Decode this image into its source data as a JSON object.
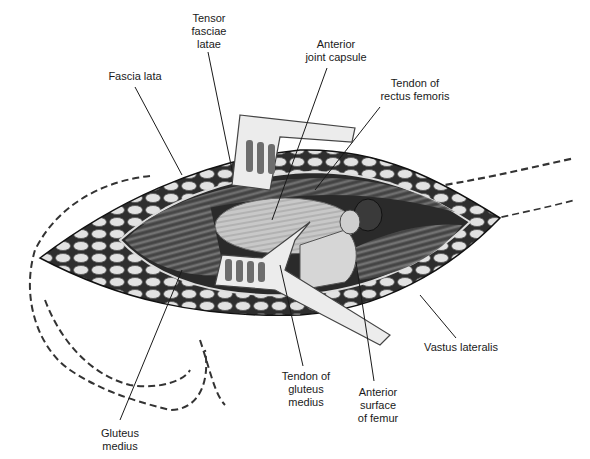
{
  "figure": {
    "colors": {
      "background": "#ffffff",
      "ink": "#1a1a1a",
      "fat": "#d8d8d8",
      "fat_dark": "#3a3a3a",
      "muscle": "#6b6b6b",
      "capsule": "#bdbdbd",
      "retractor": "#e6e6e6"
    }
  },
  "labels": {
    "tensor_fasciae_latae": [
      "Tensor",
      "fasciae",
      "latae"
    ],
    "fascia_lata": [
      "Fascia lata"
    ],
    "anterior_joint_capsule": [
      "Anterior",
      "joint capsule"
    ],
    "tendon_rectus_femoris": [
      "Tendon of",
      "rectus femoris"
    ],
    "vastus_lateralis": [
      "Vastus lateralis"
    ],
    "tendon_gluteus_medius": [
      "Tendon of",
      "gluteus",
      "medius"
    ],
    "anterior_surface_femur": [
      "Anterior",
      "surface",
      "of femur"
    ],
    "gluteus_medius": [
      "Gluteus",
      "medius"
    ]
  }
}
